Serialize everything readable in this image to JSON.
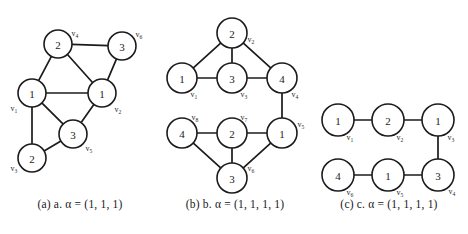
{
  "figure": {
    "background_color": "#ffffff",
    "line_color": "#1b1b1d",
    "text_color": "#1a1a1a"
  },
  "panels": [
    {
      "id": "a",
      "caption": "(a) a. α = (1, 1, 1)",
      "caption_prefix": "(a)",
      "caption_name": "a.",
      "alpha_symbol": "α",
      "alpha_value": "(1, 1, 1)",
      "nodes": [
        {
          "id": "v1",
          "weight": "1",
          "label": "v",
          "sub": "1",
          "cx": 32,
          "cy": 93,
          "r": 14,
          "label_dx": -18,
          "label_dy": 15
        },
        {
          "id": "v2",
          "weight": "1",
          "label": "v",
          "sub": "2",
          "cx": 102,
          "cy": 93,
          "r": 14,
          "label_dx": 16,
          "label_dy": 16
        },
        {
          "id": "v3",
          "weight": "2",
          "label": "v",
          "sub": "3",
          "cx": 32,
          "cy": 158,
          "r": 14,
          "label_dx": -18,
          "label_dy": 10
        },
        {
          "id": "v4",
          "weight": "2",
          "label": "v",
          "sub": "4",
          "cx": 58,
          "cy": 44,
          "r": 14,
          "label_dx": 17,
          "label_dy": -11
        },
        {
          "id": "v5",
          "weight": "3",
          "label": "v",
          "sub": "5",
          "cx": 73,
          "cy": 134,
          "r": 14,
          "label_dx": 16,
          "label_dy": 14
        },
        {
          "id": "v6",
          "weight": "3",
          "label": "v",
          "sub": "6",
          "cx": 122,
          "cy": 46,
          "r": 14,
          "label_dx": 17,
          "label_dy": -12
        }
      ],
      "edges": [
        [
          "v1",
          "v2"
        ],
        [
          "v1",
          "v3"
        ],
        [
          "v1",
          "v4"
        ],
        [
          "v1",
          "v5"
        ],
        [
          "v2",
          "v4"
        ],
        [
          "v2",
          "v5"
        ],
        [
          "v2",
          "v6"
        ],
        [
          "v3",
          "v5"
        ],
        [
          "v4",
          "v6"
        ]
      ]
    },
    {
      "id": "b",
      "caption": "(b) b. α = (1, 1, 1, 1)",
      "caption_prefix": "(b)",
      "caption_name": "b.",
      "alpha_symbol": "α",
      "alpha_value": "(1, 1, 1, 1)",
      "nodes": [
        {
          "id": "v1",
          "weight": "1",
          "label": "v",
          "sub": "1",
          "cx": 27,
          "cy": 78,
          "r": 15,
          "label_dx": 12,
          "label_dy": 16
        },
        {
          "id": "v2",
          "weight": "2",
          "label": "v",
          "sub": "2",
          "cx": 77,
          "cy": 33,
          "r": 15,
          "label_dx": 19,
          "label_dy": 6
        },
        {
          "id": "v3",
          "weight": "3",
          "label": "v",
          "sub": "3",
          "cx": 77,
          "cy": 78,
          "r": 15,
          "label_dx": 12,
          "label_dy": 16
        },
        {
          "id": "v4",
          "weight": "4",
          "label": "v",
          "sub": "4",
          "cx": 127,
          "cy": 78,
          "r": 15,
          "label_dx": 13,
          "label_dy": 16
        },
        {
          "id": "v5",
          "weight": "1",
          "label": "v",
          "sub": "5",
          "cx": 127,
          "cy": 133,
          "r": 15,
          "label_dx": 19,
          "label_dy": -9
        },
        {
          "id": "v6",
          "weight": "3",
          "label": "v",
          "sub": "6",
          "cx": 77,
          "cy": 178,
          "r": 15,
          "label_dx": 19,
          "label_dy": -10
        },
        {
          "id": "v7",
          "weight": "2",
          "label": "v",
          "sub": "7",
          "cx": 77,
          "cy": 133,
          "r": 15,
          "label_dx": 12,
          "label_dy": -16
        },
        {
          "id": "v8",
          "weight": "4",
          "label": "v",
          "sub": "8",
          "cx": 27,
          "cy": 133,
          "r": 15,
          "label_dx": 13,
          "label_dy": -16
        }
      ],
      "edges": [
        [
          "v1",
          "v2"
        ],
        [
          "v1",
          "v3"
        ],
        [
          "v2",
          "v3"
        ],
        [
          "v2",
          "v4"
        ],
        [
          "v3",
          "v4"
        ],
        [
          "v4",
          "v5"
        ],
        [
          "v5",
          "v7"
        ],
        [
          "v5",
          "v6"
        ],
        [
          "v7",
          "v8"
        ],
        [
          "v7",
          "v6"
        ],
        [
          "v8",
          "v6"
        ]
      ]
    },
    {
      "id": "c",
      "caption": "(c) c. α = (1, 1, 1, 1)",
      "caption_prefix": "(c)",
      "caption_name": "c.",
      "alpha_symbol": "α",
      "alpha_value": "(1, 1, 1, 1)",
      "nodes": [
        {
          "id": "v1",
          "weight": "1",
          "label": "v",
          "sub": "1",
          "cx": 28,
          "cy": 120,
          "r": 16,
          "label_dx": 12,
          "label_dy": 17
        },
        {
          "id": "v2",
          "weight": "2",
          "label": "v",
          "sub": "2",
          "cx": 78,
          "cy": 120,
          "r": 16,
          "label_dx": 12,
          "label_dy": 17
        },
        {
          "id": "v3",
          "weight": "1",
          "label": "v",
          "sub": "3",
          "cx": 128,
          "cy": 120,
          "r": 16,
          "label_dx": 13,
          "label_dy": 17
        },
        {
          "id": "v4",
          "weight": "3",
          "label": "v",
          "sub": "4",
          "cx": 128,
          "cy": 175,
          "r": 16,
          "label_dx": 14,
          "label_dy": 16
        },
        {
          "id": "v5",
          "weight": "1",
          "label": "v",
          "sub": "5",
          "cx": 78,
          "cy": 175,
          "r": 16,
          "label_dx": 12,
          "label_dy": 17
        },
        {
          "id": "v6",
          "weight": "4",
          "label": "v",
          "sub": "6",
          "cx": 28,
          "cy": 175,
          "r": 16,
          "label_dx": 12,
          "label_dy": 17
        }
      ],
      "edges": [
        [
          "v1",
          "v2"
        ],
        [
          "v2",
          "v3"
        ],
        [
          "v3",
          "v4"
        ],
        [
          "v4",
          "v5"
        ],
        [
          "v5",
          "v6"
        ]
      ]
    }
  ]
}
